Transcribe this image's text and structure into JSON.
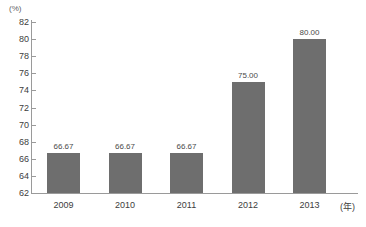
{
  "chart_data": {
    "type": "bar",
    "title": "",
    "xlabel": "(年)",
    "ylabel": "(%)",
    "categories": [
      "2009",
      "2010",
      "2011",
      "2012",
      "2013"
    ],
    "values": [
      66.67,
      66.67,
      66.67,
      75.0,
      80.0
    ],
    "value_labels": [
      "66.67",
      "66.67",
      "66.67",
      "75.00",
      "80.00"
    ],
    "ylim": [
      62,
      82
    ],
    "ytick_step": 2,
    "ytick_labels": [
      "82",
      "80",
      "78",
      "76",
      "74",
      "72",
      "70",
      "68",
      "66",
      "64",
      "62"
    ],
    "ytick_values": [
      82,
      80,
      78,
      76,
      74,
      72,
      70,
      68,
      66,
      64,
      62
    ],
    "grid": false,
    "legend": null,
    "series": [
      {
        "name": "",
        "values": [
          66.67,
          66.67,
          66.67,
          75.0,
          80.0
        ]
      }
    ],
    "colors": {
      "bar": "#6e6e6e",
      "axis": "#9a9a9a",
      "text": "#3d3d3d",
      "value_text": "#4a4a4a",
      "background": "#ffffff"
    }
  }
}
